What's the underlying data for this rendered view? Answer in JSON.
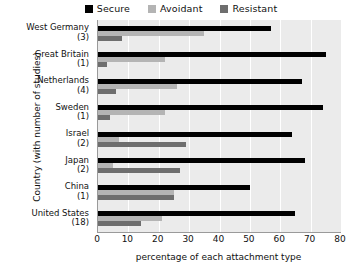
{
  "chart_data": {
    "type": "bar",
    "orientation": "horizontal",
    "title": "",
    "xlabel": "percentage of each attachment type",
    "ylabel": "Country (with number of studies)",
    "xlim": [
      0,
      80
    ],
    "xticks": [
      0,
      10,
      20,
      30,
      40,
      50,
      60,
      70,
      80
    ],
    "grid": true,
    "legend_position": "top",
    "categories": [
      "West Germany",
      "Great Britain",
      "Netherlands",
      "Sweden",
      "Israel",
      "Japan",
      "China",
      "United States"
    ],
    "category_sublabels": [
      "(3)",
      "(1)",
      "(4)",
      "(1)",
      "(2)",
      "(2)",
      "(1)",
      "(18)"
    ],
    "studies": [
      3,
      1,
      4,
      1,
      2,
      2,
      1,
      18
    ],
    "series": [
      {
        "name": "Secure",
        "color": "#000000",
        "values": [
          57,
          75,
          67,
          74,
          64,
          68,
          50,
          65
        ]
      },
      {
        "name": "Avoidant",
        "color": "#b4b4b4",
        "values": [
          35,
          22,
          26,
          22,
          7,
          5,
          25,
          21
        ]
      },
      {
        "name": "Resistant",
        "color": "#6e6e6e",
        "values": [
          8,
          3,
          6,
          4,
          29,
          27,
          25,
          14
        ]
      }
    ]
  },
  "legend": {
    "entries": [
      {
        "label": "Secure",
        "color": "#000000",
        "icon": "square-swatch-icon"
      },
      {
        "label": "Avoidant",
        "color": "#b4b4b4",
        "icon": "square-swatch-icon"
      },
      {
        "label": "Resistant",
        "color": "#6e6e6e",
        "icon": "square-swatch-icon"
      }
    ]
  },
  "axes": {
    "x_title": "percentage of each attachment type",
    "y_title": "Country (with number of studies)",
    "x_tick_labels": [
      "0",
      "10",
      "20",
      "30",
      "40",
      "50",
      "60",
      "70",
      "80"
    ]
  },
  "colors": {
    "plot_background": "#ebebeb",
    "gridline": "#ffffff",
    "axis_line": "#9a9a9a",
    "text": "#111111"
  }
}
